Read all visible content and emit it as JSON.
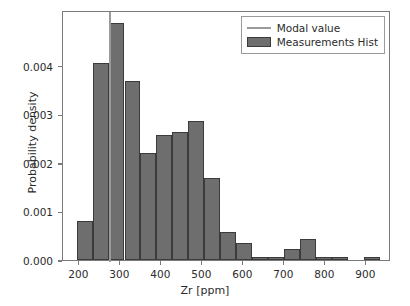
{
  "chart_data": {
    "type": "bar",
    "title": "",
    "xlabel": "Zr [ppm]",
    "ylabel": "Probability density",
    "xlim": [
      160,
      960
    ],
    "ylim": [
      0.0,
      0.00515
    ],
    "grid": false,
    "legend_position": "upper right",
    "xticks": [
      200,
      300,
      400,
      500,
      600,
      700,
      800,
      900
    ],
    "xtick_labels": [
      "200",
      "300",
      "400",
      "500",
      "600",
      "700",
      "800",
      "900"
    ],
    "yticks": [
      0.0,
      0.001,
      0.002,
      0.003,
      0.004
    ],
    "ytick_labels": [
      "0.000",
      "0.001",
      "0.002",
      "0.003",
      "0.004"
    ],
    "bin_edges": [
      193,
      232,
      271,
      310,
      349,
      388,
      427,
      466,
      505,
      544,
      583,
      622,
      661,
      700,
      739,
      778,
      817,
      856,
      895,
      934
    ],
    "bin_centers": [
      212.5,
      251.5,
      290.5,
      329.5,
      368.5,
      407.5,
      446.5,
      485.5,
      524.5,
      563.5,
      602.5,
      641.5,
      680.5,
      719.5,
      758.5,
      797.5,
      836.5,
      875.5,
      914.5
    ],
    "values": [
      0.0008,
      0.00405,
      0.00489,
      0.00368,
      0.0022,
      0.00257,
      0.00263,
      0.00286,
      0.00168,
      0.00058,
      0.00036,
      6e-05,
      6e-05,
      0.00022,
      0.00043,
      6e-05,
      6e-05,
      0.0,
      6e-05
    ],
    "series": [
      {
        "name": "Measurements Hist",
        "values": [
          0.0008,
          0.00405,
          0.00489,
          0.00368,
          0.0022,
          0.00257,
          0.00263,
          0.00286,
          0.00168,
          0.00058,
          0.00036,
          6e-05,
          6e-05,
          0.00022,
          0.00043,
          6e-05,
          6e-05,
          0.0,
          6e-05
        ]
      }
    ],
    "annotations": [
      {
        "name": "modal-value-line",
        "type": "vline",
        "x": 275
      }
    ],
    "legend_entries": [
      {
        "label": "Modal value",
        "marker": "line",
        "color": "#9a9a9a"
      },
      {
        "label": "Measurements Hist",
        "marker": "patch",
        "color": "#6e6e6e"
      }
    ],
    "colors": {
      "bar_fill": "#6e6e6e",
      "bar_edge": "#3b3b3b",
      "modal_line": "#9a9a9a",
      "axis": "#7a7a7a",
      "text": "#2b2b2b",
      "background": "#ffffff"
    }
  }
}
